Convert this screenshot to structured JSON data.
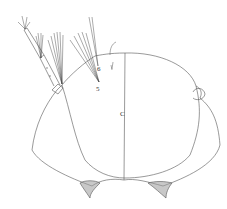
{
  "figure": {
    "type": "biological line drawing",
    "labels": [
      {
        "id": "seta-6",
        "text": "6",
        "x": 98,
        "y": 70
      },
      {
        "id": "seta-5",
        "text": "5",
        "x": 97,
        "y": 90
      },
      {
        "id": "suture-c",
        "text": "C",
        "x": 121,
        "y": 116
      }
    ],
    "colors": {
      "line": "#555555",
      "background": "#ffffff"
    }
  }
}
